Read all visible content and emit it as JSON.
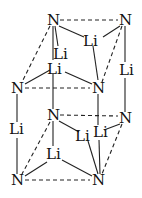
{
  "diagram": {
    "title": "",
    "atoms": {
      "n_top_back_left": "N",
      "n_top_back_right": "N",
      "n_top_front_left": "N",
      "n_top_front_right": "N",
      "n_mid_back_left": "N",
      "n_mid_back_right": "N",
      "n_bottom_front_left": "N",
      "n_bottom_front_right": "N",
      "li_top_face_center": "Li",
      "li_top_inner_1": "Li",
      "li_top_inner_2": "Li",
      "li_right_edge": "Li",
      "li_left_edge": "Li",
      "li_bottom_face_1": "Li",
      "li_bottom_face_2": "Li",
      "li_bottom_face_3": "Li"
    },
    "colors": {
      "line": "#222222",
      "text": "#111111",
      "background": "#ffffff"
    }
  }
}
